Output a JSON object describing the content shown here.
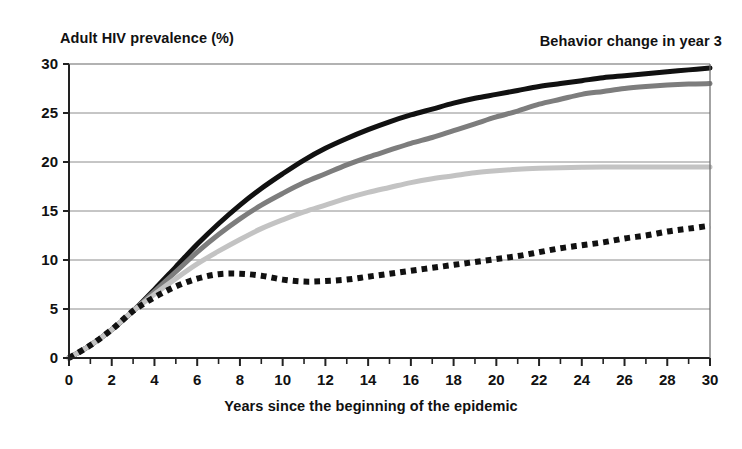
{
  "chart_data": {
    "type": "line",
    "title": "",
    "ylabel": "Adult HIV prevalence (%)",
    "xlabel": "Years since the beginning of the epidemic",
    "annotation": "Behavior change in year 3",
    "xlim": [
      0,
      30
    ],
    "ylim": [
      0,
      30
    ],
    "xticks": [
      0,
      2,
      4,
      6,
      8,
      10,
      12,
      14,
      16,
      18,
      20,
      22,
      24,
      26,
      28,
      30
    ],
    "yticks": [
      0,
      5,
      10,
      15,
      20,
      25,
      30
    ],
    "xtick_step_minor": 1,
    "grid": "horizontal",
    "grid_color": "#808080",
    "legend": "none",
    "x": [
      0,
      1,
      2,
      3,
      4,
      5,
      6,
      7,
      8,
      9,
      10,
      11,
      12,
      13,
      14,
      15,
      16,
      17,
      18,
      19,
      20,
      21,
      22,
      23,
      24,
      25,
      26,
      27,
      28,
      29,
      30
    ],
    "series": [
      {
        "name": "No behavior change",
        "style": "solid",
        "color": "#111111",
        "width": 5,
        "values": [
          0,
          1.3,
          2.9,
          4.8,
          7.0,
          9.3,
          11.6,
          13.7,
          15.6,
          17.3,
          18.8,
          20.2,
          21.4,
          22.4,
          23.3,
          24.1,
          24.8,
          25.4,
          26.0,
          26.5,
          26.9,
          27.3,
          27.7,
          28.0,
          28.3,
          28.6,
          28.8,
          29.0,
          29.2,
          29.4,
          29.6
        ]
      },
      {
        "name": "Modest behavior change",
        "style": "solid",
        "color": "#7d7d7d",
        "width": 5,
        "values": [
          0,
          1.3,
          2.9,
          4.8,
          6.8,
          8.8,
          10.8,
          12.6,
          14.2,
          15.6,
          16.8,
          17.9,
          18.8,
          19.7,
          20.5,
          21.2,
          21.9,
          22.5,
          23.2,
          23.9,
          24.6,
          25.2,
          25.9,
          26.4,
          26.9,
          27.2,
          27.5,
          27.7,
          27.85,
          27.95,
          28.0
        ]
      },
      {
        "name": "Greater behavior change",
        "style": "solid",
        "color": "#c3c3c3",
        "width": 5,
        "values": [
          0,
          1.3,
          2.9,
          4.8,
          6.5,
          8.1,
          9.6,
          10.9,
          12.1,
          13.2,
          14.1,
          14.9,
          15.6,
          16.3,
          16.9,
          17.4,
          17.9,
          18.3,
          18.6,
          18.9,
          19.1,
          19.25,
          19.35,
          19.42,
          19.46,
          19.48,
          19.5,
          19.5,
          19.5,
          19.5,
          19.5
        ]
      },
      {
        "name": "Largest behavior change",
        "style": "dotted",
        "color": "#111111",
        "width": 6,
        "values": [
          0,
          1.3,
          2.9,
          4.8,
          6.2,
          7.3,
          8.1,
          8.55,
          8.6,
          8.4,
          8.0,
          7.8,
          7.85,
          8.0,
          8.3,
          8.6,
          8.9,
          9.2,
          9.5,
          9.8,
          10.1,
          10.4,
          10.8,
          11.2,
          11.5,
          11.8,
          12.2,
          12.5,
          12.9,
          13.2,
          13.5
        ]
      }
    ]
  }
}
